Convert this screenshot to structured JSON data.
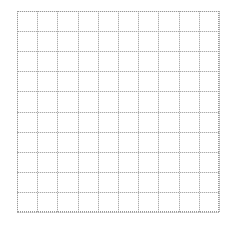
{
  "canvas": {
    "width": 236,
    "height": 226,
    "background": "#ffffff"
  },
  "grid": {
    "label": "grid",
    "left": 17,
    "top": 11,
    "width": 202,
    "height": 201,
    "columns": 10,
    "rows": 10,
    "cell_width": 20.2,
    "cell_height": 20.1,
    "solid_line_color": "#e6e6e6",
    "dotted_line_color": "#adadad",
    "frame_color": "#9a9a9a",
    "frame_style": "dotted",
    "background": "#ffffff"
  },
  "chart_data": {
    "type": "table",
    "title": "",
    "subtitle": "",
    "xlabel": "",
    "ylabel": "",
    "categories": [],
    "values": [],
    "series": [],
    "tick_labels_x": [],
    "tick_labels_y": [],
    "legend": [],
    "legend_position": "none",
    "annotations": [],
    "grid": "on",
    "grid_columns": 10,
    "grid_rows": 10,
    "xlim": [
      0,
      10
    ],
    "ylim": [
      0,
      10
    ]
  }
}
